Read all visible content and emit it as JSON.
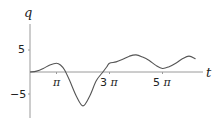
{
  "chart_data": {
    "type": "line",
    "title": "",
    "xlabel": "t",
    "ylabel": "q",
    "x_unit": "pi",
    "xlim": [
      0,
      6.6
    ],
    "ylim": [
      -10,
      10.5
    ],
    "grid": false,
    "legend": null,
    "x_ticks": [
      {
        "value": 1,
        "label": "π"
      },
      {
        "value": 3,
        "label": "3 π"
      },
      {
        "value": 5,
        "label": "5 π"
      }
    ],
    "y_ticks": [
      {
        "value": 5,
        "label": "5"
      },
      {
        "value": -5,
        "label": "−5"
      }
    ],
    "series": [
      {
        "name": "q(t)",
        "color": "#555555",
        "x": [
          0,
          0.25,
          0.5,
          0.75,
          1.0,
          1.15,
          1.3,
          1.5,
          1.75,
          2.0,
          2.25,
          2.5,
          2.75,
          2.9,
          3.0,
          3.25,
          3.5,
          3.75,
          4.0,
          4.25,
          4.5,
          4.75,
          5.0,
          5.25,
          5.5,
          5.75,
          6.0,
          6.25
        ],
        "y": [
          0,
          0.2,
          0.8,
          1.6,
          2.0,
          1.6,
          0.5,
          -2.0,
          -5.5,
          -7.7,
          -5.5,
          -2.0,
          0.0,
          1.2,
          2.0,
          2.3,
          2.9,
          3.6,
          3.9,
          3.4,
          2.6,
          1.5,
          0.8,
          1.2,
          2.0,
          3.0,
          3.6,
          3.0
        ]
      }
    ]
  },
  "labels": {
    "y_axis": "q",
    "x_axis": "t",
    "y_tick_pos": "5",
    "y_tick_neg": "−5",
    "x_tick_1_num": "",
    "x_tick_3_num": "3",
    "x_tick_5_num": "5",
    "pi": "π"
  },
  "colors": {
    "curve": "#555555",
    "axis": "#9a9a9a",
    "text": "#222222"
  }
}
